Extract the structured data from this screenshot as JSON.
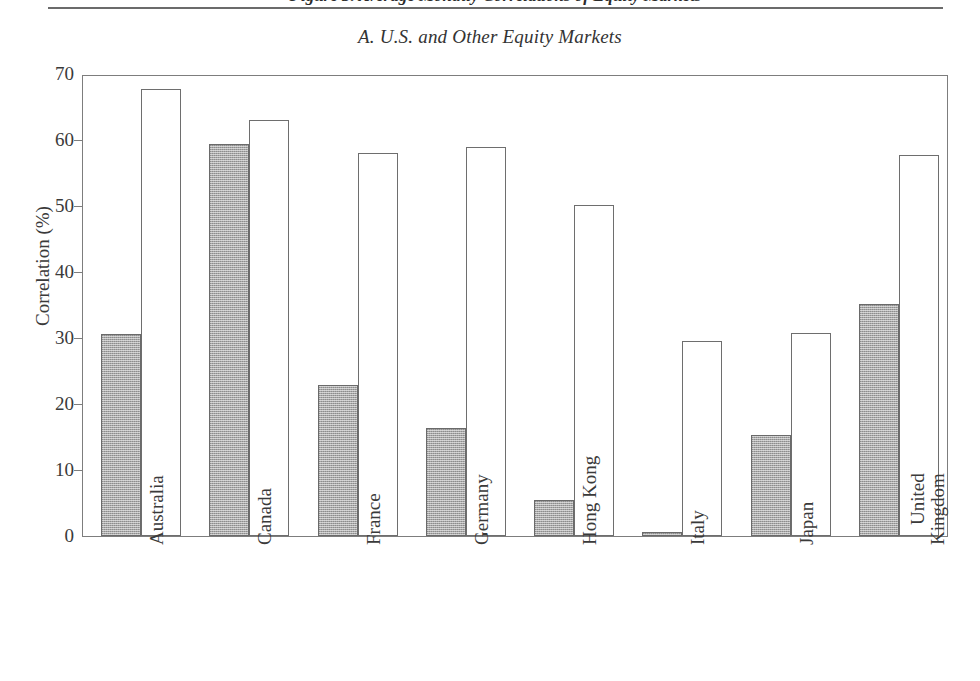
{
  "header": {
    "running_head": "Figure 3. Average Monthly Correlations of Equity Markets"
  },
  "panel": {
    "title": "A. U.S. and Other Equity Markets"
  },
  "chart_data": {
    "type": "bar",
    "title": "A. U.S. and Other Equity Markets",
    "xlabel": "",
    "ylabel": "Correlation (%)",
    "ylim": [
      0,
      70
    ],
    "yticks": [
      0,
      10,
      20,
      30,
      40,
      50,
      60,
      70
    ],
    "ytick_labels": [
      "0",
      "10",
      "20",
      "30",
      "40",
      "50",
      "60",
      "70"
    ],
    "grid": false,
    "legend": null,
    "categories": [
      "Australia",
      "Canada",
      "France",
      "Germany",
      "Hong Kong",
      "Italy",
      "Japan",
      "United Kingdom"
    ],
    "category_lines": [
      [
        "Australia"
      ],
      [
        "Canada"
      ],
      [
        "France"
      ],
      [
        "Germany"
      ],
      [
        "Hong Kong"
      ],
      [
        "Italy"
      ],
      [
        "Japan"
      ],
      [
        "United",
        "Kingdom"
      ]
    ],
    "series": [
      {
        "name": "series-gray",
        "style": "shaded",
        "color": "#a8a8a8",
        "values": [
          30.6,
          59.4,
          22.9,
          16.4,
          5.5,
          0.6,
          15.3,
          35.2
        ]
      },
      {
        "name": "series-white",
        "style": "open",
        "color": "#ffffff",
        "values": [
          67.8,
          63.1,
          58.0,
          58.9,
          50.1,
          29.5,
          30.8,
          57.8
        ]
      }
    ]
  }
}
